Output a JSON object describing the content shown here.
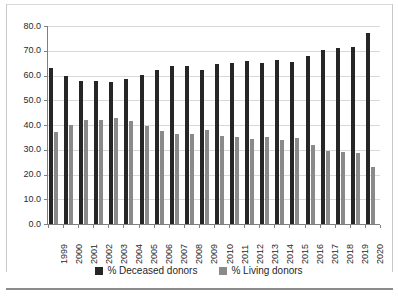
{
  "chart_data": {
    "type": "bar",
    "title": "",
    "subtitle": "",
    "xlabel": "",
    "ylabel": "",
    "ylim": [
      0,
      80
    ],
    "y_ticks": [
      "0.0",
      "10.0",
      "20.0",
      "30.0",
      "40.0",
      "50.0",
      "60.0",
      "70.0",
      "80.0"
    ],
    "y_tick_values": [
      0,
      10,
      20,
      30,
      40,
      50,
      60,
      70,
      80
    ],
    "grid": true,
    "legend_position": "bottom",
    "categories": [
      "1999",
      "2000",
      "2001",
      "2002",
      "2003",
      "2004",
      "2005",
      "2006",
      "2007",
      "2008",
      "2009",
      "2010",
      "2011",
      "2012",
      "2013",
      "2014",
      "2015",
      "2016",
      "2017",
      "2018",
      "2019",
      "2020"
    ],
    "series": [
      {
        "name": "% Deceased donors",
        "color": "#262626",
        "values": [
          63.0,
          59.8,
          57.8,
          57.8,
          57.2,
          58.5,
          60.2,
          62.4,
          63.8,
          63.8,
          62.2,
          64.6,
          65.0,
          65.8,
          65.0,
          66.2,
          65.3,
          68.0,
          70.5,
          71.0,
          71.5,
          77.0
        ]
      },
      {
        "name": "% Living donors",
        "color": "#8a8a8a",
        "values": [
          37.0,
          40.2,
          42.2,
          42.2,
          42.8,
          41.5,
          39.8,
          37.6,
          36.2,
          36.2,
          37.8,
          35.4,
          35.0,
          34.2,
          35.0,
          33.8,
          34.7,
          32.0,
          29.5,
          29.0,
          28.5,
          23.0
        ]
      }
    ]
  },
  "legend": {
    "items": [
      {
        "label": "% Deceased donors",
        "color": "#262626"
      },
      {
        "label": "% Living donors",
        "color": "#8a8a8a"
      }
    ]
  }
}
